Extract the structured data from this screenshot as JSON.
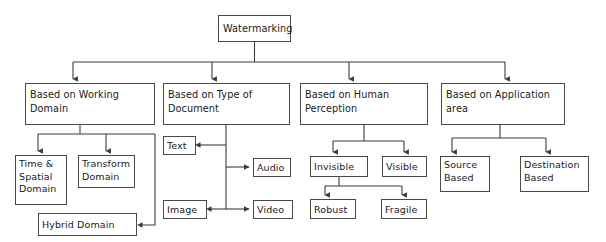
{
  "diagram": {
    "title": "Watermarking",
    "type": "tree-hierarchy",
    "root": {
      "id": "watermarking",
      "label": "Watermarking",
      "x": 218,
      "y": 15,
      "w": 73,
      "h": 27
    },
    "categories": [
      {
        "id": "working-domain",
        "label": "Based on Working\nDomain",
        "x": 25,
        "y": 83,
        "w": 130,
        "h": 42,
        "children": [
          {
            "id": "time-spatial-domain",
            "label": "Time &\nSpatial\nDomain",
            "x": 15,
            "y": 155,
            "w": 52,
            "h": 50
          },
          {
            "id": "transform-domain",
            "label": "Transform\nDomain",
            "x": 78,
            "y": 155,
            "w": 57,
            "h": 33
          },
          {
            "id": "hybrid-domain",
            "label": "Hybrid Domain",
            "x": 38,
            "y": 213,
            "w": 99,
            "h": 23
          }
        ]
      },
      {
        "id": "type-of-document",
        "label": "Based on Type of\nDocument",
        "x": 163,
        "y": 83,
        "w": 127,
        "h": 42,
        "children": [
          {
            "id": "text",
            "label": "Text",
            "x": 163,
            "y": 136,
            "w": 33,
            "h": 19
          },
          {
            "id": "audio",
            "label": "Audio",
            "x": 253,
            "y": 158,
            "w": 38,
            "h": 19
          },
          {
            "id": "image",
            "label": "Image",
            "x": 163,
            "y": 200,
            "w": 44,
            "h": 19
          },
          {
            "id": "video",
            "label": "Video",
            "x": 253,
            "y": 200,
            "w": 40,
            "h": 19
          }
        ]
      },
      {
        "id": "human-perception",
        "label": "Based on Human\nPerception",
        "x": 300,
        "y": 83,
        "w": 128,
        "h": 42,
        "children": [
          {
            "id": "invisible",
            "label": "Invisible",
            "x": 310,
            "y": 156,
            "w": 58,
            "h": 21
          },
          {
            "id": "visible",
            "label": "Visible",
            "x": 382,
            "y": 156,
            "w": 45,
            "h": 21
          },
          {
            "id": "robust",
            "label": "Robust",
            "x": 310,
            "y": 199,
            "w": 46,
            "h": 20
          },
          {
            "id": "fragile",
            "label": "Fragile",
            "x": 381,
            "y": 199,
            "w": 46,
            "h": 20
          }
        ]
      },
      {
        "id": "application-area",
        "label": "Based on Application\narea",
        "x": 441,
        "y": 83,
        "w": 124,
        "h": 42,
        "children": [
          {
            "id": "source-based",
            "label": "Source\nBased",
            "x": 440,
            "y": 156,
            "w": 50,
            "h": 36
          },
          {
            "id": "destination-based",
            "label": "Destination\nBased",
            "x": 520,
            "y": 156,
            "w": 69,
            "h": 36
          }
        ]
      }
    ],
    "colors": {
      "box_border": "#4a4a4a",
      "box_fill": "#ffffff",
      "connector": "#3b3b3b",
      "text": "#1a1a1a",
      "background": "#ffffff"
    }
  }
}
